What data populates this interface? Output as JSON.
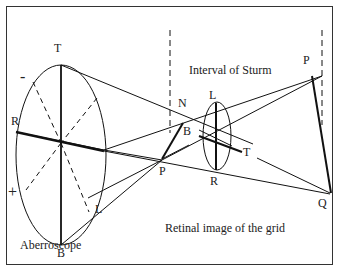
{
  "figure": {
    "labels": {
      "aberroscope_T": "T",
      "aberroscope_R": "R",
      "aberroscope_B": "B",
      "aberroscope_L": "L",
      "minus": "-",
      "plus": "+",
      "N": "N",
      "B_mid": "B",
      "P_mid": "P",
      "L_right": "L",
      "R_right": "R",
      "T_right": "T",
      "P_far": "P",
      "Q_far": "Q",
      "interval": "Interval of Sturm",
      "retinal": "Retinal image of the grid",
      "aberroscope": "Aberroscope"
    },
    "colors": {
      "line": "#111111",
      "frame": "#333333",
      "text": "#222222"
    }
  }
}
